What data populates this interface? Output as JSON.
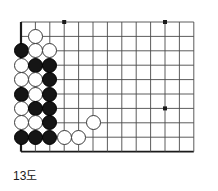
{
  "figure": {
    "caption": "13도",
    "kind": "go-board-diagram"
  },
  "board": {
    "colors": {
      "line": "#4a4a4a",
      "edge": "#1a1a1a",
      "black_stone": "#151515",
      "white_stone": "#ffffff",
      "white_stone_border": "#3a3a3a",
      "background": "#ffffff"
    },
    "geometry": {
      "origin_x": 21,
      "origin_y": 22,
      "step": 14.4,
      "cols": 13,
      "rows": 10,
      "stone_diameter": 15
    },
    "star_points": [
      {
        "col": 3,
        "row": 0
      },
      {
        "col": 10,
        "row": 0
      },
      {
        "col": 10,
        "row": 6
      }
    ],
    "stones": [
      {
        "col": 1,
        "row": 1,
        "color": "white"
      },
      {
        "col": 0,
        "row": 2,
        "color": "black"
      },
      {
        "col": 1,
        "row": 2,
        "color": "white"
      },
      {
        "col": 2,
        "row": 2,
        "color": "white"
      },
      {
        "col": 0,
        "row": 3,
        "color": "white"
      },
      {
        "col": 1,
        "row": 3,
        "color": "black"
      },
      {
        "col": 2,
        "row": 3,
        "color": "black"
      },
      {
        "col": 0,
        "row": 4,
        "color": "white"
      },
      {
        "col": 1,
        "row": 4,
        "color": "white"
      },
      {
        "col": 2,
        "row": 4,
        "color": "black"
      },
      {
        "col": 0,
        "row": 5,
        "color": "black"
      },
      {
        "col": 1,
        "row": 5,
        "color": "white"
      },
      {
        "col": 2,
        "row": 5,
        "color": "black"
      },
      {
        "col": 0,
        "row": 6,
        "color": "white"
      },
      {
        "col": 1,
        "row": 6,
        "color": "black"
      },
      {
        "col": 2,
        "row": 6,
        "color": "black"
      },
      {
        "col": 0,
        "row": 7,
        "color": "white"
      },
      {
        "col": 1,
        "row": 7,
        "color": "white"
      },
      {
        "col": 2,
        "row": 7,
        "color": "black"
      },
      {
        "col": 5,
        "row": 7,
        "color": "white"
      },
      {
        "col": 0,
        "row": 8,
        "color": "black"
      },
      {
        "col": 1,
        "row": 8,
        "color": "black"
      },
      {
        "col": 2,
        "row": 8,
        "color": "black"
      },
      {
        "col": 3,
        "row": 8,
        "color": "white"
      },
      {
        "col": 4,
        "row": 8,
        "color": "white"
      }
    ]
  }
}
